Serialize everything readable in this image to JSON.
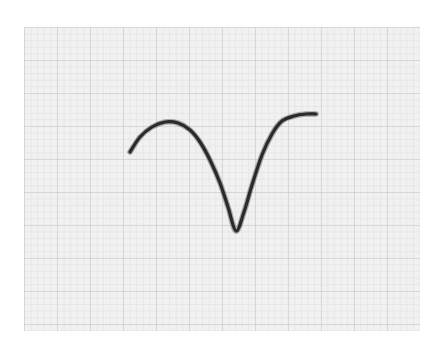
{
  "chart_data": {
    "type": "line",
    "title": "",
    "xlabel": "",
    "ylabel": "",
    "grid": true,
    "legend": null,
    "coordinate_units": "pixels (image space, y increases downward)",
    "x": [
      130,
      140,
      152,
      165,
      178,
      190,
      200,
      210,
      220,
      228,
      236,
      244,
      252,
      262,
      272,
      282,
      294,
      306,
      316
    ],
    "y": [
      152,
      137,
      127,
      122,
      123,
      130,
      142,
      160,
      183,
      207,
      231,
      212,
      185,
      155,
      134,
      121,
      116,
      114,
      114
    ],
    "paper_bounds": {
      "left": 24,
      "top": 27,
      "right": 420,
      "bottom": 331
    },
    "grid_spacing_px": {
      "minor": 6.6,
      "major": 33
    }
  },
  "style": {
    "paper_color": "#f1f1f1",
    "grid_minor_color": "#e1e1e1",
    "grid_major_color": "#c8c8c8",
    "trace_color": "#2a2a2a"
  }
}
